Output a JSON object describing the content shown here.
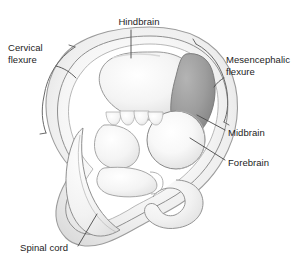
{
  "figure": {
    "kind": "anatomical-diagram",
    "background_color": "#ffffff"
  },
  "labels": {
    "hindbrain": "Hindbrain",
    "cervical_flexure": "Cervical\nflexure",
    "mesencephalic_flexure": "Mesencephalic\nflexure",
    "midbrain": "Midbrain",
    "forebrain": "Forebrain",
    "spinal_cord": "Spinal cord"
  },
  "colors": {
    "outline": "#8c8c8c",
    "outline_dark": "#6f6f6f",
    "body_fill": "#f7f7f7",
    "amnion_fill": "#f0f0f0",
    "hindbrain_fill": "#f2f2f2",
    "midbrain_fill": "#9a9a9a",
    "forebrain_fill": "#fafafa",
    "leader_line": "#4a4a4a",
    "bracket": "#6a6a6a",
    "text": "#1c1c1c"
  },
  "structures": [
    {
      "name": "hindbrain",
      "shading": "light-gray",
      "region": "upper-left vesicle"
    },
    {
      "name": "midbrain",
      "shading": "medium-gray",
      "region": "upper-right crest"
    },
    {
      "name": "forebrain",
      "shading": "pale-gray",
      "region": "right round vesicle"
    },
    {
      "name": "spinal-cord",
      "shading": "pale-gray",
      "region": "curving tail band"
    },
    {
      "name": "cervical-flexure",
      "shading": "bracket",
      "region": "left outer margin"
    },
    {
      "name": "mesencephalic-flexure",
      "shading": "bracket",
      "region": "right outer margin"
    },
    {
      "name": "pharyngeal-arches",
      "shading": "pale-gray",
      "region": "central scallops"
    }
  ]
}
